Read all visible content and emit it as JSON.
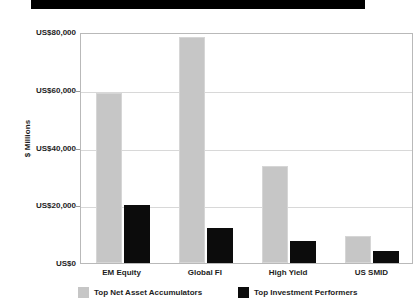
{
  "chart_data": {
    "type": "bar",
    "title": "",
    "title_redacted": true,
    "categories": [
      "EM Equity",
      "Global FI",
      "High Yield",
      "US SMID"
    ],
    "series": [
      {
        "name": "Top Net Asset Accumulators",
        "color": "#c6c6c6",
        "values": [
          58800,
          78300,
          33600,
          9400
        ]
      },
      {
        "name": "Top Investment Performers",
        "color": "#0c0c0c",
        "values": [
          20100,
          12100,
          7600,
          4200
        ]
      }
    ],
    "xlabel": "",
    "ylabel": "$ Millions",
    "ylim": [
      0,
      80000
    ],
    "ytick_values": [
      0,
      20000,
      40000,
      60000,
      80000
    ],
    "ytick_labels": [
      "US$0",
      "US$20,000",
      "US$40,000",
      "US$60,000",
      "US$80,000"
    ],
    "grid": true,
    "legend_position": "bottom"
  },
  "axis": {
    "y_title": "$ Millions"
  },
  "legend": {
    "items": [
      {
        "label": "Top Net Asset Accumulators",
        "color": "#c6c6c6"
      },
      {
        "label": "Top Investment Performers",
        "color": "#0c0c0c"
      }
    ]
  }
}
